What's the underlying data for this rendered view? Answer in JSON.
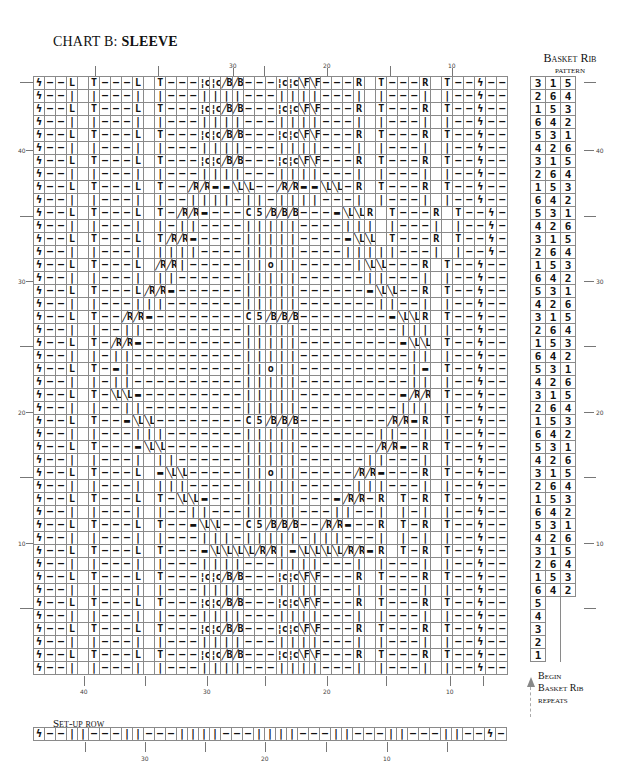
{
  "title": {
    "prefix": "CHART B: ",
    "bold": "SLEEVE"
  },
  "basket_rib_title": {
    "line1": "Basket Rib",
    "line2": "pattern"
  },
  "setup_label": "Set-up row",
  "begin_label": {
    "line1": "Begin",
    "line2": "Basket Rib",
    "line3": "repeats"
  },
  "axis": {
    "top_labels": [
      {
        "text": "30",
        "x": 233
      },
      {
        "text": "20",
        "x": 327
      },
      {
        "text": "10",
        "x": 452
      }
    ],
    "bottom_labels": [
      {
        "text": "40",
        "x": 82
      },
      {
        "text": "30",
        "x": 205
      },
      {
        "text": "20",
        "x": 325
      },
      {
        "text": "10",
        "x": 448
      }
    ],
    "right_labels": [
      {
        "text": "40",
        "y": 150
      },
      {
        "text": "30",
        "y": 281
      },
      {
        "text": "20",
        "y": 412
      },
      {
        "text": "10",
        "y": 543
      }
    ],
    "left_labels": [
      {
        "text": "40",
        "y": 150
      },
      {
        "text": "30",
        "y": 281
      },
      {
        "text": "20",
        "y": 412
      },
      {
        "text": "10",
        "y": 543
      }
    ],
    "setup_labels": [
      {
        "text": "30",
        "x": 145
      },
      {
        "text": "20",
        "x": 265
      },
      {
        "text": "10",
        "x": 387
      }
    ]
  },
  "legend_symbols": {
    "~": "twisted-st",
    "-": "purl",
    "|": "knit",
    "L": "left-cross",
    "T": "right-twist",
    "R": "right-cross",
    "C": "cable-start",
    "5": "cable-5",
    "O": "bobble",
    "#": "thick-bar",
    "a": "cable-c4-left",
    "b": "cable-b-right",
    "f": "cable-f",
    "r": "cable-R-diag",
    "l": "cable-L-diag"
  },
  "chart_data": {
    "type": "table",
    "title": "CHART B: SLEEVE",
    "columns": 43,
    "rows_count": 46,
    "rows": [
      "~--L T---L T---aabb---aaff---R T---R T--~",
      "~--| |---| |---||||---||||---| |---| |--~",
      "~--L T---L T---aabb---aaff---R T---R T--~",
      "~--| |---| |---||||---||||---| |---| |--~",
      "~--L T---L T---aabb---aaff---R T---R T--~",
      "~--| |---| |---||||---||||---| |---| |--~",
      "~--L T---L T---aabb---aaff---R T---R T--~",
      "~--| |---| |---||||---||||---| |---| |--~",
      "~--L T---L T--rr##ll--rr##ll-R T---R T--~",
      "~--| |---| |--||||-||-||||---| |---| |--~",
      "~--L T---L T-rr#---C5bbb---#llR T---R T--~",
      "~--| |---| |-||----|||||----||| |---| |--~",
      "~--L T---L Trr#----|||||----#ll T---R T--~",
      "~--| |---| ||||----|||||----|||||---| |--~",
      "~--L T---L rr|-----||O||-----|ll---R T--~",
      "~--| |---| ||------|||||------||---| |--~",
      "~--L T---Lrr#------|||||------#ll--R T--~",
      "~--| |---|||-------|||||-------||--| |--~",
      "~--L T--rr#--------C5bbb--------#llR T--~",
      "~--| |--||---------|||||---------||| |--~",
      "~--L T-rr#---------|||||---------#ll T--~",
      "~--| |-||----------|||||----------|| |--~",
      "~--L T-#|----------||O||----------|# T--~",
      "~--| |-||----------|||||----------|| |--~",
      "~--L T-ll#---------|||||---------#rr T--~",
      "~--| |--||---------|||||---------||| |--~",
      "~--L T--#ll--------C5bbb--------rr#R T--~",
      "~--| |---|||-------|||||-------||--| |--~",
      "~--L T---#ll-------|||||-------rr#-R T--~",
      "~--| |---| ||------|||||------||---| |--~",
      "~--L T---L #ll-----||O||-----rr#---R T--~",
      "~--| |---| |||-----|||||-----|||---| |--~",
      "~--L T---L T-ll#---|||||---#rr-R T-R T--~",
      "~--| |---| |--||---|||||---||--| |-| |--~",
      "~--L T---L T--#ll--C5bbb--rr#--R T-R T--~",
      "~--| |---| |---|||-|||||-|||---| |-| |--~",
      "~--L T---L T---#llllrr|#llllrr#R T-R T--~",
      "~--| |---| |---||||---||||---| |---| |--~",
      "~--L T---L T---aabb---aaff---R T---R T--~",
      "~--| |---| |---||||---||||---| |---| |--~",
      "~--L T---L T---aabb---aaff---R T---R T--~",
      "~--| |---| |---||||---||||---| |---| |--~",
      "~--L T---L T---aabb---aaff---R T---R T--~",
      "~--| |---| |---||||---||||---| |---| |--~",
      "~--L T---L T---aabb---aaff---R T---R T--~",
      "~--| |---| |---||||---||||---| |---| |--~"
    ],
    "setup_row": "~--||---||---||||---||||---||---||---||--~",
    "basket_rib": {
      "rows": [
        [
          "3",
          "1",
          "5"
        ],
        [
          "2",
          "6",
          "4"
        ],
        [
          "1",
          "5",
          "3"
        ],
        [
          "6",
          "4",
          "2"
        ],
        [
          "5",
          "3",
          "1"
        ],
        [
          "4",
          "2",
          "6"
        ],
        [
          "3",
          "1",
          "5"
        ],
        [
          "2",
          "6",
          "4"
        ],
        [
          "1",
          "5",
          "3"
        ],
        [
          "6",
          "4",
          "2"
        ],
        [
          "5",
          "3",
          "1"
        ],
        [
          "4",
          "2",
          "6"
        ],
        [
          "3",
          "1",
          "5"
        ],
        [
          "2",
          "6",
          "4"
        ],
        [
          "1",
          "5",
          "3"
        ],
        [
          "6",
          "4",
          "2"
        ],
        [
          "5",
          "3",
          "1"
        ],
        [
          "4",
          "2",
          "6"
        ],
        [
          "3",
          "1",
          "5"
        ],
        [
          "2",
          "6",
          "4"
        ],
        [
          "1",
          "5",
          "3"
        ],
        [
          "6",
          "4",
          "2"
        ],
        [
          "5",
          "3",
          "1"
        ],
        [
          "4",
          "2",
          "6"
        ],
        [
          "3",
          "1",
          "5"
        ],
        [
          "2",
          "6",
          "4"
        ],
        [
          "1",
          "5",
          "3"
        ],
        [
          "6",
          "4",
          "2"
        ],
        [
          "5",
          "3",
          "1"
        ],
        [
          "4",
          "2",
          "6"
        ],
        [
          "3",
          "1",
          "5"
        ],
        [
          "2",
          "6",
          "4"
        ],
        [
          "1",
          "5",
          "3"
        ],
        [
          "6",
          "4",
          "2"
        ],
        [
          "5",
          "3",
          "1"
        ],
        [
          "4",
          "2",
          "6"
        ],
        [
          "3",
          "1",
          "5"
        ],
        [
          "2",
          "6",
          "4"
        ],
        [
          "1",
          "5",
          "3"
        ],
        [
          "6",
          "4",
          "2"
        ],
        [
          "5",
          "",
          ""
        ],
        [
          "4",
          "",
          ""
        ],
        [
          "3",
          "",
          ""
        ],
        [
          "2",
          "",
          ""
        ],
        [
          "1",
          "",
          ""
        ]
      ]
    }
  }
}
